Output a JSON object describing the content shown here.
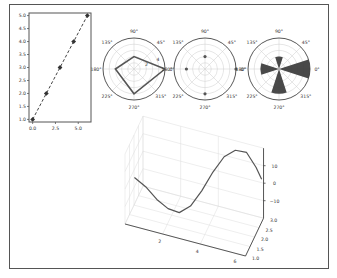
{
  "figure": {
    "border_color": "#555555",
    "ink_color": "#444444",
    "grid_color": "#cccccc"
  },
  "chart_data": [
    {
      "type": "line",
      "name": "line-plot",
      "title": "",
      "xlabel": "",
      "ylabel": "",
      "x": [
        0.0,
        1.5,
        3.0,
        4.5,
        6.0
      ],
      "y": [
        1.0,
        2.0,
        3.0,
        4.0,
        5.0
      ],
      "style": "dashed line with diamond markers",
      "xlim": [
        -0.4,
        6.4
      ],
      "ylim": [
        0.9,
        5.1
      ],
      "xticks": [
        "0.0",
        "2.5",
        "5.0"
      ],
      "yticks": [
        "1.0",
        "1.5",
        "2.0",
        "2.5",
        "3.0",
        "3.5",
        "4.0",
        "4.5",
        "5.0"
      ],
      "grid": false
    },
    {
      "type": "polar-line",
      "name": "polar-line-plot",
      "theta_ticks": [
        "0°",
        "45°",
        "90°",
        "135°",
        "180°",
        "225°",
        "270°",
        "315°"
      ],
      "r_ticks": [
        "2",
        "4"
      ],
      "theta_deg": [
        0,
        90,
        180,
        270,
        0
      ],
      "r": [
        5,
        2,
        3,
        4,
        5
      ],
      "rlim": [
        0,
        5
      ],
      "closed": true
    },
    {
      "type": "polar-scatter",
      "name": "polar-scatter-plot",
      "theta_ticks": [
        "0°",
        "45°",
        "90°",
        "135°",
        "180°",
        "225°",
        "270°",
        "315°"
      ],
      "r_ticks": [],
      "theta_deg": [
        0,
        90,
        180,
        270
      ],
      "r": [
        5,
        2,
        3,
        4
      ],
      "rlim": [
        0,
        5
      ]
    },
    {
      "type": "polar-bar",
      "name": "polar-bar-plot",
      "theta_ticks": [
        "0°",
        "45°",
        "90°",
        "135°",
        "180°",
        "225°",
        "270°",
        "315°"
      ],
      "r_ticks": [],
      "theta_deg": [
        0,
        90,
        180,
        270
      ],
      "r": [
        5,
        2,
        3,
        4
      ],
      "bar_width_deg": 36,
      "rlim": [
        0,
        5
      ]
    },
    {
      "type": "line3d",
      "name": "3d-line-plot",
      "x": [
        0.5,
        1.0,
        1.5,
        2.0,
        2.5,
        3.0,
        3.5,
        4.0,
        4.5,
        5.0,
        5.5,
        6.0,
        6.3
      ],
      "y": [
        1.0,
        1.2,
        1.4,
        1.6,
        1.8,
        2.0,
        2.2,
        2.4,
        2.6,
        2.8,
        3.0,
        3.0,
        3.0
      ],
      "z": [
        8,
        2,
        -6,
        -12,
        -15,
        -12,
        -4,
        6,
        14,
        17,
        15,
        8,
        2
      ],
      "xticks": [
        "2",
        "4",
        "6"
      ],
      "yticks": [
        "1.0",
        "1.5",
        "2.0",
        "2.5",
        "3.0"
      ],
      "zticks": [
        "−10",
        "0",
        "10"
      ]
    }
  ]
}
